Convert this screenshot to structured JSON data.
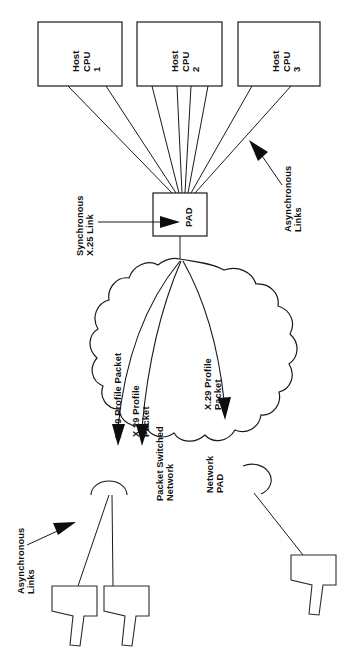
{
  "diagram": {
    "orientation": "rotated-90",
    "background_color": "#ffffff",
    "line_color": "#1a1a1a",
    "hosts": [
      {
        "id": "host-cpu-1",
        "line1": "Host",
        "line2": "CPU",
        "line3": "1",
        "links_to_pad": 2
      },
      {
        "id": "host-cpu-2",
        "line1": "Host",
        "line2": "CPU",
        "line3": "2",
        "links_to_pad": 4
      },
      {
        "id": "host-cpu-3",
        "line1": "Host",
        "line2": "CPU",
        "line3": "3",
        "links_to_pad": 2
      }
    ],
    "pad": {
      "label": "PAD"
    },
    "cloud": {
      "line1": "Packet Switched",
      "line2": "Network"
    },
    "network_pad": {
      "line1": "Network",
      "line2": "PAD"
    },
    "annotations": [
      {
        "id": "async-links-top",
        "line1": "Asynchronous",
        "line2": "Links"
      },
      {
        "id": "sync-x25-link",
        "line1": "Synchronous",
        "line2": "X.25 Link"
      },
      {
        "id": "async-links-bottom",
        "line1": "Asynchronous",
        "line2": "Links"
      }
    ],
    "flows": [
      {
        "id": "x29-flow-1",
        "line1": "X.29 Profile Packet",
        "line2": ""
      },
      {
        "id": "x29-flow-2",
        "line1": "X.29 Profile",
        "line2": "Packet"
      },
      {
        "id": "x29-flow-3",
        "line1": "X.29 Profile",
        "line2": "Packet"
      }
    ],
    "terminals": [
      {
        "id": "terminal-1"
      },
      {
        "id": "terminal-2"
      },
      {
        "id": "terminal-3"
      }
    ]
  }
}
